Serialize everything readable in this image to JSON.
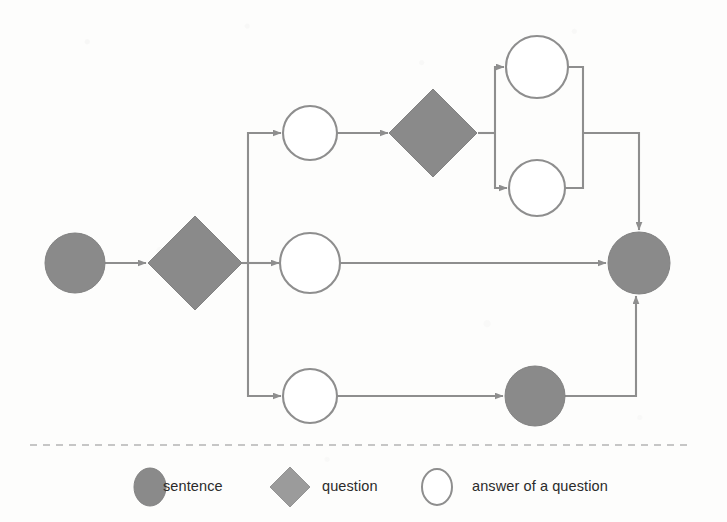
{
  "diagram": {
    "type": "flow-graph",
    "orientation": "left-to-right",
    "background_color": "#fdfdfc",
    "shape_fill_gray": "#8a8a8a",
    "shape_fill_white": "#ffffff",
    "stroke_color": "#8e8e8e",
    "nodes": [
      {
        "id": "start-sentence",
        "kind": "sentence",
        "shape": "circle",
        "cx": 75,
        "cy": 263,
        "r": 30,
        "label": ""
      },
      {
        "id": "question-1",
        "kind": "question",
        "shape": "diamond",
        "cx": 195,
        "cy": 263,
        "half": 47,
        "label": ""
      },
      {
        "id": "answer-1-top",
        "kind": "answer",
        "shape": "circle",
        "cx": 310,
        "cy": 133,
        "r": 27,
        "label": ""
      },
      {
        "id": "answer-1-middle",
        "kind": "answer",
        "shape": "circle",
        "cx": 310,
        "cy": 263,
        "r": 30,
        "label": ""
      },
      {
        "id": "answer-1-bottom",
        "kind": "answer",
        "shape": "circle",
        "cx": 310,
        "cy": 396,
        "r": 27,
        "label": ""
      },
      {
        "id": "question-2",
        "kind": "question",
        "shape": "diamond",
        "cx": 433,
        "cy": 133,
        "half": 44,
        "label": ""
      },
      {
        "id": "answer-2-upper",
        "kind": "answer",
        "shape": "circle",
        "cx": 537,
        "cy": 67,
        "r": 31,
        "label": ""
      },
      {
        "id": "answer-2-lower",
        "kind": "answer",
        "shape": "circle",
        "cx": 537,
        "cy": 188,
        "r": 28,
        "label": ""
      },
      {
        "id": "sentence-bottom",
        "kind": "sentence",
        "shape": "circle",
        "cx": 535,
        "cy": 396,
        "r": 30,
        "label": ""
      },
      {
        "id": "end-sentence",
        "kind": "sentence",
        "shape": "circle",
        "cx": 639,
        "cy": 263,
        "r": 31,
        "label": ""
      }
    ],
    "edges": [
      {
        "id": "edge-start-to-question1",
        "from": "start-sentence",
        "to": "question-1"
      },
      {
        "id": "edge-question1-to-answer-top",
        "from": "question-1",
        "to": "answer-1-top"
      },
      {
        "id": "edge-question1-to-answer-middle",
        "from": "question-1",
        "to": "answer-1-middle"
      },
      {
        "id": "edge-question1-to-answer-bottom",
        "from": "question-1",
        "to": "answer-1-bottom"
      },
      {
        "id": "edge-answer-top-to-question2",
        "from": "answer-1-top",
        "to": "question-2"
      },
      {
        "id": "edge-question2-to-answer-upper",
        "from": "question-2",
        "to": "answer-2-upper"
      },
      {
        "id": "edge-question2-to-answer-lower",
        "from": "question-2",
        "to": "answer-2-lower"
      },
      {
        "id": "edge-answer-upper-to-end",
        "from": "answer-2-upper",
        "to": "end-sentence"
      },
      {
        "id": "edge-answer-lower-to-end",
        "from": "answer-2-lower",
        "to": "end-sentence"
      },
      {
        "id": "edge-answer-middle-to-end",
        "from": "answer-1-middle",
        "to": "end-sentence"
      },
      {
        "id": "edge-answer-bottom-to-sentence",
        "from": "answer-1-bottom",
        "to": "sentence-bottom"
      },
      {
        "id": "edge-sentence-bottom-to-end",
        "from": "sentence-bottom",
        "to": "end-sentence"
      }
    ]
  },
  "divider": {
    "style": "dashed",
    "y": 445,
    "x_start": 30,
    "x_end": 690
  },
  "legend": {
    "items": [
      {
        "id": "legend-sentence",
        "label": "sentence",
        "shape": "circle",
        "fill": "#8a8a8a",
        "marker_x": 150,
        "text_x": 163
      },
      {
        "id": "legend-question",
        "label": "question",
        "shape": "diamond",
        "fill": "#8a8a8a",
        "marker_x": 290,
        "text_x": 322
      },
      {
        "id": "legend-answer",
        "label": "answer of a question",
        "shape": "circle",
        "fill": "#ffffff",
        "marker_x": 437,
        "text_x": 472
      }
    ],
    "row_y": 487
  }
}
